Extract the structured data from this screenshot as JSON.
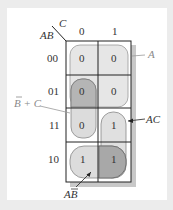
{
  "kmap": {
    "row_var": "AB",
    "col_var": "C",
    "col_headers": [
      "0",
      "1"
    ],
    "row_headers": [
      "00",
      "01",
      "11",
      "10"
    ],
    "cells": [
      [
        "0",
        "0"
      ],
      [
        "0",
        "0"
      ],
      [
        "0",
        "1"
      ],
      [
        "1",
        "1"
      ]
    ]
  },
  "annotations": {
    "a": "A",
    "b_bar_plus_c": "B + C",
    "ac": "AC",
    "ab_bar": "AB"
  },
  "colors": {
    "group_fill": "#e6e6e6",
    "overlap_fill": "#b0b0b0",
    "shadow": "#c8c8c8",
    "grid_line": "#222222"
  }
}
